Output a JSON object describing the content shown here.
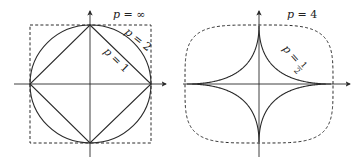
{
  "figure": {
    "colors": {
      "stroke": "#2a2a2a",
      "background": "#ffffff"
    },
    "left_panel": {
      "center": [
        90,
        84
      ],
      "radius": 60,
      "curves": [
        {
          "p": "1",
          "shape": "diamond",
          "style": "solid"
        },
        {
          "p": "2",
          "shape": "circle",
          "style": "solid"
        },
        {
          "p": "∞",
          "shape": "square",
          "style": "dashed"
        }
      ],
      "labels": {
        "p_inf": {
          "var": "p",
          "eq": " = ",
          "val": "∞"
        },
        "p_2": {
          "var": "p",
          "eq": " = ",
          "val": "2"
        },
        "p_1": {
          "var": "p",
          "eq": " = ",
          "val": "1"
        }
      }
    },
    "right_panel": {
      "center": [
        259,
        84
      ],
      "radius": 72,
      "curves": [
        {
          "p": "4",
          "shape": "superellipse",
          "style": "dashed"
        },
        {
          "p": "1/2",
          "shape": "astroid-like",
          "style": "solid"
        }
      ],
      "labels": {
        "p_4": {
          "var": "p",
          "eq": " = ",
          "val": "4"
        },
        "p_half": {
          "var": "p",
          "eq": " = ",
          "num": "1",
          "den": "2"
        }
      }
    }
  }
}
